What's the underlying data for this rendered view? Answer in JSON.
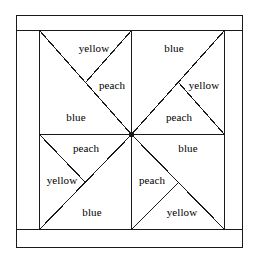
{
  "figure": {
    "name": "pinwheel-quilt-block",
    "stroke_color": "#1a1a1a",
    "background_color": "#ffffff",
    "fill_color": "#ffffff"
  },
  "frame": {
    "outer": {
      "x": 16,
      "y": 15,
      "width": 227,
      "height": 233
    },
    "inner_block": {
      "x": 39,
      "y": 30,
      "width": 186,
      "height": 200
    },
    "center": {
      "x": 132,
      "y": 135
    },
    "mid_x": 132,
    "mid_y": 135
  },
  "patches": [
    {
      "id": "tl-top",
      "quadrant": "top-left",
      "label": "yellow",
      "x": 94,
      "y": 48
    },
    {
      "id": "tr-top",
      "quadrant": "top-right",
      "label": "blue",
      "x": 174,
      "y": 48
    },
    {
      "id": "tl-right",
      "quadrant": "top-left",
      "label": "peach",
      "x": 112,
      "y": 85
    },
    {
      "id": "tr-upper-right",
      "quadrant": "top-right",
      "label": "yellow",
      "x": 204,
      "y": 85
    },
    {
      "id": "tl-bottom",
      "quadrant": "top-left",
      "label": "blue",
      "x": 76,
      "y": 117
    },
    {
      "id": "tr-lower",
      "quadrant": "top-right",
      "label": "peach",
      "x": 179,
      "y": 117
    },
    {
      "id": "bl-top",
      "quadrant": "bottom-left",
      "label": "peach",
      "x": 86,
      "y": 148
    },
    {
      "id": "br-top",
      "quadrant": "bottom-right",
      "label": "blue",
      "x": 188,
      "y": 148
    },
    {
      "id": "bl-left",
      "quadrant": "bottom-left",
      "label": "yellow",
      "x": 62,
      "y": 180
    },
    {
      "id": "br-left",
      "quadrant": "bottom-right",
      "label": "peach",
      "x": 152,
      "y": 180
    },
    {
      "id": "bl-bottom",
      "quadrant": "bottom-left",
      "label": "blue",
      "x": 92,
      "y": 212
    },
    {
      "id": "br-bottom",
      "quadrant": "bottom-right",
      "label": "yellow",
      "x": 182,
      "y": 212
    }
  ]
}
